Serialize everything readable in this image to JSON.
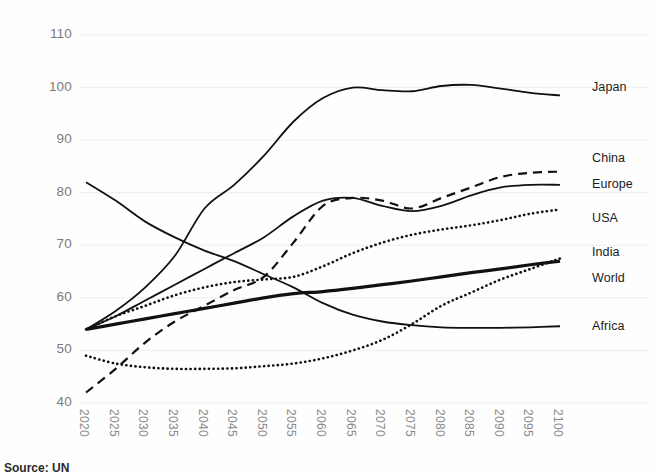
{
  "source_note": "Source: UN",
  "axes": {
    "y_ticks": [
      "110",
      "100",
      "90",
      "80",
      "70",
      "60",
      "50",
      "40"
    ],
    "x_ticks": [
      "2020",
      "2025",
      "2030",
      "2035",
      "2040",
      "2045",
      "2050",
      "2055",
      "2060",
      "2065",
      "2070",
      "2075",
      "2080",
      "2085",
      "2090",
      "2095",
      "2100"
    ]
  },
  "series_labels": {
    "japan": "Japan",
    "china": "China",
    "europe": "Europe",
    "usa": "USA",
    "india": "India",
    "world": "World",
    "africa": "Africa"
  },
  "colors": {
    "line": "#111111",
    "gridline": "#ededed",
    "tick_text": "#7b7b7b",
    "label_text": "#1b1b1b",
    "background": "#fefefe"
  },
  "chart_data": {
    "type": "line",
    "title": "",
    "xlabel": "",
    "ylabel": "",
    "xlim": [
      2020,
      2100
    ],
    "ylim": [
      40,
      110
    ],
    "grid": true,
    "legend_position": "right-inline-end-of-line",
    "x": [
      2020,
      2025,
      2030,
      2035,
      2040,
      2045,
      2050,
      2055,
      2060,
      2065,
      2070,
      2075,
      2080,
      2085,
      2090,
      2095,
      2100
    ],
    "series": [
      {
        "name": "Japan",
        "style": "solid",
        "width": 1.8,
        "values": [
          54,
          57.5,
          62,
          68,
          77,
          81.5,
          87,
          93.5,
          98,
          100,
          99.5,
          99.3,
          100.3,
          100.5,
          99.8,
          99,
          98.5
        ]
      },
      {
        "name": "China",
        "style": "dashed",
        "width": 2.2,
        "values": [
          42,
          46.5,
          51.5,
          55.5,
          58.5,
          61.5,
          64,
          70.5,
          77.5,
          79,
          78.5,
          77,
          79,
          81,
          83,
          83.8,
          84
        ]
      },
      {
        "name": "Europe",
        "style": "solid",
        "width": 1.8,
        "values": [
          54,
          56.5,
          59.5,
          62.5,
          65.5,
          68.5,
          71.5,
          75.5,
          78.5,
          79,
          77.5,
          76.5,
          77.5,
          79.5,
          81,
          81.5,
          81.5
        ]
      },
      {
        "name": "USA",
        "style": "dotted",
        "width": 2.6,
        "values": [
          54,
          56.5,
          58.5,
          60.5,
          62,
          63,
          63.5,
          64,
          66,
          68.5,
          70.5,
          72,
          73,
          73.8,
          74.8,
          76,
          76.8
        ]
      },
      {
        "name": "India",
        "style": "dotted",
        "width": 2.6,
        "values": [
          49,
          47.5,
          46.8,
          46.5,
          46.5,
          46.6,
          47,
          47.5,
          48.5,
          50,
          52,
          55,
          58.5,
          61,
          63.5,
          65.5,
          67.5
        ]
      },
      {
        "name": "World",
        "style": "solid-thick",
        "width": 3.2,
        "values": [
          54,
          55,
          56,
          57,
          58,
          59,
          60,
          60.8,
          61.2,
          61.8,
          62.5,
          63.2,
          64,
          64.8,
          65.5,
          66.3,
          67
        ]
      },
      {
        "name": "Africa",
        "style": "solid",
        "width": 1.8,
        "values": [
          82,
          78.5,
          74.5,
          71.5,
          69,
          67,
          64.5,
          62,
          59,
          56.8,
          55.5,
          54.8,
          54.4,
          54.3,
          54.3,
          54.4,
          54.6
        ]
      }
    ]
  },
  "label_positions": {
    "japan_y": 100,
    "china_y": 86.5,
    "europe_y": 81.5,
    "usa_y": 75,
    "india_y": 68.5,
    "world_y": 63.5,
    "africa_y": 54.5
  }
}
